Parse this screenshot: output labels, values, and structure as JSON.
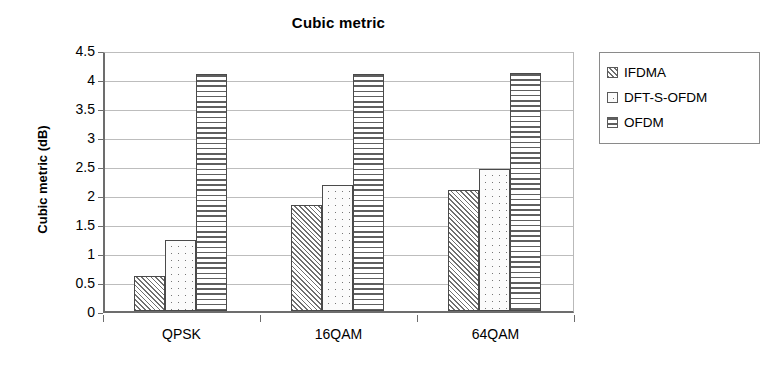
{
  "chart_data": {
    "type": "bar",
    "title": "Cubic metric",
    "xlabel": "",
    "ylabel": "Cubic metric (dB)",
    "categories": [
      "QPSK",
      "16QAM",
      "64QAM"
    ],
    "series": [
      {
        "name": "IFDMA",
        "pattern": "diagonal-hatch",
        "values": [
          0.6,
          1.82,
          2.08
        ]
      },
      {
        "name": "DFT-S-OFDM",
        "pattern": "dot-grid",
        "values": [
          1.22,
          2.18,
          2.44
        ]
      },
      {
        "name": "OFDM",
        "pattern": "horizontal-lines",
        "values": [
          4.08,
          4.09,
          4.11
        ]
      }
    ],
    "ylim": [
      0,
      4.5
    ],
    "ytick_labels": [
      "4.5",
      "4",
      "3.5",
      "3",
      "2.5",
      "2",
      "1.5",
      "1",
      "0.5",
      "0"
    ],
    "ytick_values": [
      4.5,
      4,
      3.5,
      3,
      2.5,
      2,
      1.5,
      1,
      0.5,
      0
    ],
    "grid": true,
    "legend_position": "right",
    "legend_entries": [
      "IFDMA",
      "DFT-S-OFDM",
      "OFDM"
    ],
    "colors": {
      "plot_background": "#ffffff",
      "axis": "#6d6d6d",
      "gridline": "#bdbdbd",
      "bar_outline": "#4a4a4a",
      "pattern_ink": "#6f6f6f",
      "text": "#000000"
    }
  }
}
